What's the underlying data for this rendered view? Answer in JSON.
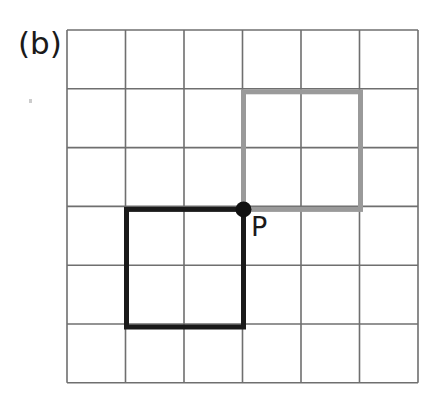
{
  "figure": {
    "panel_label": "(b)",
    "point_label": "P",
    "background_color": "#ffffff"
  },
  "grid": {
    "columns": 6,
    "rows": 6,
    "left": 67,
    "top": 30,
    "cell_width": 58.5,
    "cell_height": 58.8,
    "line_color": "#6f6f6f",
    "line_width": 1.6
  },
  "shapes": [
    {
      "name": "gray-square",
      "stroke_color": "#9a9a9a",
      "stroke_width": 5,
      "x": 243.5,
      "y": 91.8,
      "width": 117,
      "height": 117.6,
      "grid_cells": "2x2",
      "grid_origin_col": 3,
      "grid_origin_row": 1
    },
    {
      "name": "black-square",
      "stroke_color": "#1a1a1a",
      "stroke_width": 5,
      "x": 126.5,
      "y": 209.4,
      "width": 117,
      "height": 117.6,
      "grid_cells": "2x2",
      "grid_origin_col": 1,
      "grid_origin_row": 3
    }
  ],
  "point": {
    "name": "point-P",
    "label": "P",
    "x": 243.5,
    "y": 209.4,
    "radius": 8,
    "color": "#111111"
  }
}
